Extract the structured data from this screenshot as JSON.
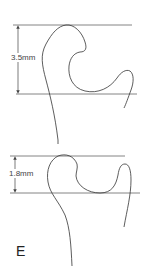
{
  "figure": {
    "panel_label": "E",
    "top_diagram": {
      "measurement_label": "3.5mm",
      "measurement_value_mm": 3.5
    },
    "bottom_diagram": {
      "measurement_label": "1.8mm",
      "measurement_value_mm": 1.8
    },
    "colors": {
      "line": "#555555",
      "curve": "#333333",
      "background": "#ffffff"
    }
  }
}
